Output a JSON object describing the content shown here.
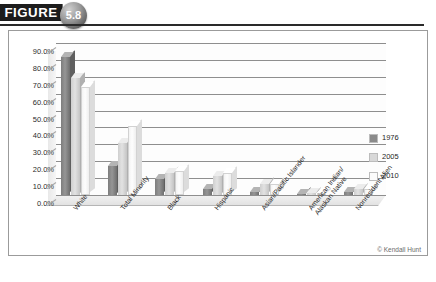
{
  "figure": {
    "tag": "FIGURE",
    "number": "5.8"
  },
  "credit": "© Kendall Hunt",
  "legend": {
    "position": "right",
    "entries": [
      {
        "label": "1976",
        "color": "#8a8a8a"
      },
      {
        "label": "2005",
        "color": "#d8d8d8"
      },
      {
        "label": "2010",
        "color": "#fbfbfb"
      }
    ]
  },
  "chart_data": {
    "type": "bar",
    "title": "",
    "subtitle": "",
    "xlabel": "",
    "ylabel": "",
    "ylim": [
      0,
      90
    ],
    "ytick_labels": [
      "0.0%",
      "10.0%",
      "20.0%",
      "30.0%",
      "40.0%",
      "50.0%",
      "60.0%",
      "70.0%",
      "80.0%",
      "90.0%"
    ],
    "ytick_values": [
      0,
      10,
      20,
      30,
      40,
      50,
      60,
      70,
      80,
      90
    ],
    "grid": true,
    "categories": [
      "White",
      "Total Minority",
      "Black",
      "Hispanic",
      "Asian/Pacific Islander",
      "American Indian/\nAlaskan Native",
      "Nonresident Alien"
    ],
    "series": [
      {
        "name": "1976",
        "values": [
          82.0,
          17.0,
          9.6,
          3.6,
          1.8,
          0.7,
          1.8
        ]
      },
      {
        "name": "2005",
        "values": [
          69.0,
          31.0,
          13.0,
          11.0,
          6.7,
          1.0,
          3.4
        ]
      },
      {
        "name": "2010",
        "values": [
          64.0,
          41.0,
          14.5,
          13.0,
          6.5,
          1.0,
          3.7
        ]
      }
    ]
  }
}
